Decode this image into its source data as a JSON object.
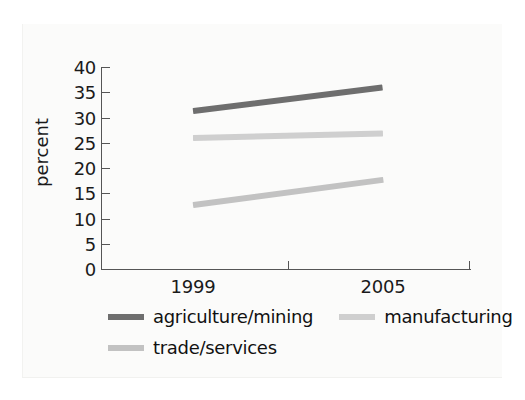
{
  "chart_data": {
    "type": "line",
    "title": "",
    "xlabel": "",
    "ylabel": "percent",
    "categories": [
      "1999",
      "2005"
    ],
    "x": [
      1999,
      2005
    ],
    "ylim": [
      0,
      40
    ],
    "xlim": [
      1999,
      2005
    ],
    "yticks": [
      40,
      35,
      30,
      25,
      20,
      15,
      10,
      5,
      0
    ],
    "ytick_labels": [
      "40",
      "35",
      "30",
      "25",
      "20",
      "15",
      "10",
      "5",
      "0"
    ],
    "xticks": [
      1999,
      2005
    ],
    "xtick_labels": [
      "1999",
      "2005"
    ],
    "grid": false,
    "legend_position": "below",
    "series": [
      {
        "name": "agriculture/mining",
        "values": [
          31.5,
          36.2
        ],
        "color": "#6e6e6e",
        "line_width": 6
      },
      {
        "name": "manufacturing",
        "values": [
          26.2,
          27.1
        ],
        "color": "#cfcfcf",
        "line_width": 6
      },
      {
        "name": "trade/services",
        "values": [
          12.9,
          17.9
        ],
        "color": "#c2c2c2",
        "line_width": 6
      }
    ]
  },
  "axes": {
    "y_title": "percent",
    "y_tick_0": "40",
    "y_tick_1": "35",
    "y_tick_2": "30",
    "y_tick_3": "25",
    "y_tick_4": "20",
    "y_tick_5": "15",
    "y_tick_6": "10",
    "y_tick_7": "5",
    "y_tick_8": "0",
    "x_tick_0": "1999",
    "x_tick_1": "2005"
  },
  "legend": {
    "items": [
      {
        "label": "agriculture/mining",
        "color": "#6e6e6e"
      },
      {
        "label": "manufacturing",
        "color": "#cfcfcf"
      },
      {
        "label": "trade/services",
        "color": "#c2c2c2"
      }
    ]
  },
  "colors": {
    "background": "#ffffff",
    "panel": "#fbfbfa",
    "axis": "#555555",
    "text": "#1a1a1a",
    "agriculture_mining": "#6e6e6e",
    "manufacturing": "#cfcfcf",
    "trade_services": "#c2c2c2"
  }
}
